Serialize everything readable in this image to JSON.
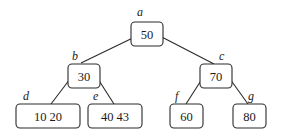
{
  "diagram": {
    "type": "tree",
    "nodes": [
      {
        "id": "a",
        "label": "a",
        "values": "50",
        "box": [
          131,
          22,
          32,
          24
        ],
        "label_pos": [
          137,
          16
        ]
      },
      {
        "id": "b",
        "label": "b",
        "values": "30",
        "box": [
          68,
          64,
          32,
          24
        ],
        "label_pos": [
          72,
          60
        ]
      },
      {
        "id": "c",
        "label": "c",
        "values": "70",
        "box": [
          200,
          64,
          32,
          24
        ],
        "label_pos": [
          219,
          60
        ]
      },
      {
        "id": "d",
        "label": "d",
        "values": "10   20",
        "box": [
          16,
          104,
          64,
          24
        ],
        "label_pos": [
          23,
          100
        ]
      },
      {
        "id": "e",
        "label": "e",
        "values": "40   43",
        "box": [
          88,
          104,
          54,
          24
        ],
        "label_pos": [
          93,
          100
        ]
      },
      {
        "id": "f",
        "label": "f",
        "values": "60",
        "box": [
          170,
          104,
          33,
          24
        ],
        "label_pos": [
          175,
          100
        ]
      },
      {
        "id": "g",
        "label": "g",
        "values": "80",
        "box": [
          233,
          104,
          33,
          24
        ],
        "label_pos": [
          248,
          100
        ]
      }
    ],
    "edges": [
      {
        "from": "a",
        "to": "b",
        "line": [
          141,
          34,
          81,
          63
        ]
      },
      {
        "from": "a",
        "to": "c",
        "line": [
          156,
          34,
          214,
          64
        ]
      },
      {
        "from": "b",
        "to": "d",
        "line": [
          70,
          79,
          51,
          104
        ]
      },
      {
        "from": "b",
        "to": "e",
        "line": [
          98,
          79,
          114,
          104
        ]
      },
      {
        "from": "c",
        "to": "f",
        "line": [
          202,
          79,
          186,
          104
        ]
      },
      {
        "from": "c",
        "to": "g",
        "line": [
          230,
          79,
          248,
          104
        ]
      }
    ]
  }
}
